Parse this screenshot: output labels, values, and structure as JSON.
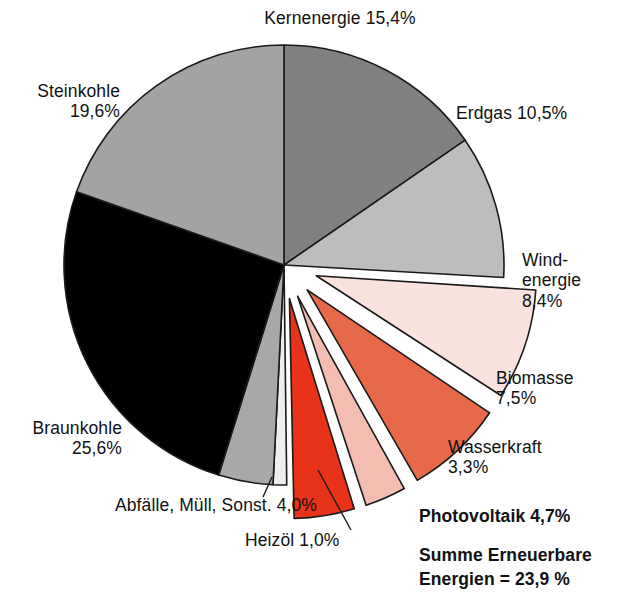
{
  "chart_data": {
    "type": "pie",
    "title": "",
    "subtitle": "",
    "xlabel": "",
    "ylabel": "",
    "units": "%",
    "decimal_separator": ",",
    "total": 100.0,
    "legend_position": "outside-labels",
    "grid": false,
    "categories": [
      "Kernenergie",
      "Erdgas",
      "Windenergie",
      "Biomasse",
      "Wasserkraft",
      "Photovoltaik",
      "Heizöl",
      "Abfälle, Müll, Sonst.",
      "Braunkohle",
      "Steinkohle"
    ],
    "values": [
      15.4,
      10.5,
      8.4,
      7.5,
      3.3,
      4.7,
      1.0,
      4.0,
      25.6,
      19.6
    ],
    "slices": [
      {
        "name": "Kernenergie",
        "value": 15.4,
        "value_label": "15,4%",
        "color": "#808080",
        "exploded": false
      },
      {
        "name": "Erdgas",
        "value": 10.5,
        "value_label": "10,5%",
        "color": "#bdbdbd",
        "exploded": false
      },
      {
        "name": "Windenergie",
        "value": 8.4,
        "value_label": "8,4%",
        "color": "#fae2de",
        "exploded": true
      },
      {
        "name": "Biomasse",
        "value": 7.5,
        "value_label": "7,5%",
        "color": "#e8694a",
        "exploded": true
      },
      {
        "name": "Wasserkraft",
        "value": 3.3,
        "value_label": "3,3%",
        "color": "#f3bdb1",
        "exploded": true
      },
      {
        "name": "Photovoltaik",
        "value": 4.7,
        "value_label": "4,7%",
        "color": "#e8321a",
        "exploded": true
      },
      {
        "name": "Heizöl",
        "value": 1.0,
        "value_label": "1,0%",
        "color": "#eeeeee",
        "exploded": false
      },
      {
        "name": "Abfälle, Müll, Sonst.",
        "value": 4.0,
        "value_label": "4,0%",
        "color": "#a8a8a8",
        "exploded": false
      },
      {
        "name": "Braunkohle",
        "value": 25.6,
        "value_label": "25,6%",
        "color": "#000000",
        "exploded": false
      },
      {
        "name": "Steinkohle",
        "value": 19.6,
        "value_label": "19,6%",
        "color": "#a3a3a3",
        "exploded": false
      }
    ],
    "annotations": [
      {
        "name": "renewables-sum",
        "text": "Summe Erneuerbare Energien = 23,9 %",
        "value": 23.9,
        "bold": true
      }
    ]
  },
  "labels": {
    "kernenergie": "Kernenergie 15,4%",
    "steinkohle": "Steinkohle\n19,6%",
    "erdgas": "Erdgas 10,5%",
    "windenergie": "Wind-\nenergie\n8,4%",
    "biomasse": "Biomasse\n7,5%",
    "wasserkraft": "Wasserkraft\n3,3%",
    "photovoltaik": "Photovoltaik 4,7%",
    "braunkohle": "Braunkohle\n25,6%",
    "abfaelle": "Abfälle, Müll, Sonst. 4,0%",
    "heizoel": "Heizöl 1,0%",
    "summe_line1": "Summe Erneuerbare",
    "summe_line2": "Energien = 23,9 %"
  },
  "style": {
    "outline": "#1a1a1a",
    "background": "#ffffff",
    "text": "#111111"
  }
}
